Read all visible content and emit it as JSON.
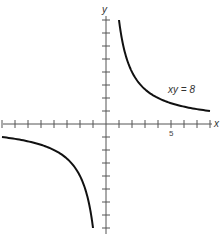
{
  "chart_data": {
    "type": "line",
    "title": "",
    "xlabel": "x",
    "ylabel": "y",
    "annotation": "xy = 8",
    "tick_labels": {
      "x": [
        "5"
      ]
    },
    "xlim": [
      -8,
      8
    ],
    "ylim": [
      -8,
      8
    ],
    "grid": false,
    "series": [
      {
        "name": "xy = 8 (first quadrant branch)",
        "equation": "y = 8/x",
        "x_range": [
          1,
          8
        ]
      },
      {
        "name": "xy = 8 (third quadrant branch)",
        "equation": "y = 8/x",
        "x_range": [
          -8,
          -1
        ]
      }
    ],
    "colors": {
      "curve": "#111111",
      "axis": "#555555"
    }
  }
}
